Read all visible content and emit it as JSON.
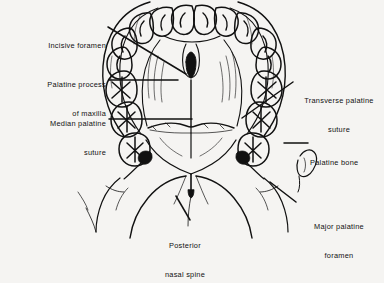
{
  "figure": {
    "background_color": "#f5f4f2",
    "ink_color": "#111111",
    "width": 384,
    "height": 250
  },
  "labels": [
    {
      "id": "incisive-foramen",
      "line1": "Incisive foramen",
      "line2": "",
      "align": "right",
      "x": 10,
      "y": 22,
      "width": 96,
      "leader": {
        "x1": 108,
        "y1": 27,
        "x2": 186,
        "y2": 74
      }
    },
    {
      "id": "palatine-process-of-maxilla",
      "line1": "Palatine process",
      "line2": "of maxilla",
      "align": "right",
      "x": 4,
      "y": 61,
      "width": 102,
      "leader": {
        "x1": 109,
        "y1": 80,
        "x2": 178,
        "y2": 80
      }
    },
    {
      "id": "median-palatine-suture",
      "line1": "Median palatine",
      "line2": "suture",
      "align": "right",
      "x": 4,
      "y": 100,
      "width": 102,
      "leader": {
        "x1": 109,
        "y1": 119,
        "x2": 192,
        "y2": 119
      }
    },
    {
      "id": "transverse-palatine-suture",
      "line1": "Transverse palatine",
      "line2": "suture",
      "align": "center",
      "x": 296,
      "y": 77,
      "width": 86,
      "leader": {
        "x1": 293,
        "y1": 82,
        "x2": 242,
        "y2": 118
      }
    },
    {
      "id": "palatine-bone",
      "line1": "Palatine bone",
      "line2": "",
      "align": "left",
      "x": 310,
      "y": 139,
      "width": 72,
      "leader": {
        "x1": 308,
        "y1": 143,
        "x2": 288,
        "y2": 143
      }
    },
    {
      "id": "major-palatine-foramen",
      "line1": "Major palatine",
      "line2": "foramen",
      "align": "center",
      "x": 297,
      "y": 203,
      "width": 84,
      "leader": {
        "x1": 296,
        "y1": 202,
        "x2": 272,
        "y2": 184
      }
    },
    {
      "id": "posterior-nasal-spine",
      "line1": "Posterior",
      "line2": "nasal spine",
      "align": "center",
      "x": 152,
      "y": 222,
      "width": 66,
      "leader": {
        "x1": 190,
        "y1": 220,
        "x2": 176,
        "y2": 196
      }
    }
  ]
}
